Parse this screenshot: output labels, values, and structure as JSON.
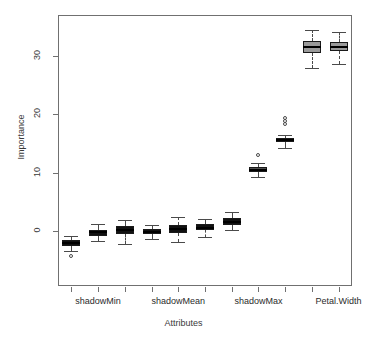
{
  "title_sliver": "",
  "chart_data": {
    "type": "box",
    "title": "",
    "xlabel": "Attributes",
    "ylabel": "Importance",
    "ylim": [
      -5,
      35
    ],
    "yticks": [
      0,
      10,
      20,
      30
    ],
    "ytick_labels": [
      "0",
      "10",
      "20",
      "30"
    ],
    "grid": false,
    "legend": null,
    "xtick_labels": [
      "shadowMin",
      "shadowMean",
      "shadowMax",
      "Petal.Width"
    ],
    "xtick_label_positions": [
      1,
      4,
      7,
      10
    ],
    "n_boxes": 11,
    "categories": [
      "shadowMin",
      "box2",
      "box3",
      "shadowMean",
      "box5",
      "box6",
      "shadowMax",
      "box8",
      "box9",
      "Petal.Width",
      "box11"
    ],
    "boxes": [
      {
        "name": "shadowMin",
        "lower_whisker": -3.4,
        "q1": -2.5,
        "median": -2.0,
        "q3": -1.6,
        "upper_whisker": -0.9,
        "outliers": [
          -4.3
        ],
        "fill": "#111111"
      },
      {
        "name": "box2",
        "lower_whisker": -1.8,
        "q1": -0.8,
        "median": -0.2,
        "q3": 0.2,
        "upper_whisker": 1.2,
        "outliers": [],
        "fill": "#111111"
      },
      {
        "name": "box3",
        "lower_whisker": -2.3,
        "q1": -0.6,
        "median": 0.1,
        "q3": 0.8,
        "upper_whisker": 1.9,
        "outliers": [],
        "fill": "#111111"
      },
      {
        "name": "shadowMean",
        "lower_whisker": -1.3,
        "q1": -0.5,
        "median": -0.1,
        "q3": 0.4,
        "upper_whisker": 1.0,
        "outliers": [],
        "fill": "#111111"
      },
      {
        "name": "box5",
        "lower_whisker": -1.9,
        "q1": -0.3,
        "median": 0.4,
        "q3": 1.1,
        "upper_whisker": 2.4,
        "outliers": [],
        "fill": "#111111"
      },
      {
        "name": "box6",
        "lower_whisker": -1.1,
        "q1": 0.2,
        "median": 0.6,
        "q3": 1.2,
        "upper_whisker": 2.1,
        "outliers": [],
        "fill": "#111111"
      },
      {
        "name": "shadowMax",
        "lower_whisker": 0.1,
        "q1": 1.1,
        "median": 1.6,
        "q3": 2.2,
        "upper_whisker": 3.2,
        "outliers": [],
        "fill": "#111111"
      },
      {
        "name": "box8",
        "lower_whisker": 9.2,
        "q1": 10.2,
        "median": 10.5,
        "q3": 10.9,
        "upper_whisker": 11.6,
        "outliers": [
          13.0
        ],
        "fill": "#4f4f4f"
      },
      {
        "name": "box9",
        "lower_whisker": 14.2,
        "q1": 15.2,
        "median": 15.6,
        "q3": 15.9,
        "upper_whisker": 16.5,
        "outliers": [
          18.4,
          18.9,
          19.3
        ],
        "fill": "#4f4f4f"
      },
      {
        "name": "Petal.Width",
        "lower_whisker": 28.0,
        "q1": 30.5,
        "median": 31.5,
        "q3": 32.6,
        "upper_whisker": 34.4,
        "outliers": [],
        "fill": "#9a9a9a"
      },
      {
        "name": "box11",
        "lower_whisker": 28.6,
        "q1": 30.8,
        "median": 31.6,
        "q3": 32.5,
        "upper_whisker": 34.2,
        "outliers": [],
        "fill": "#9a9a9a"
      }
    ]
  }
}
